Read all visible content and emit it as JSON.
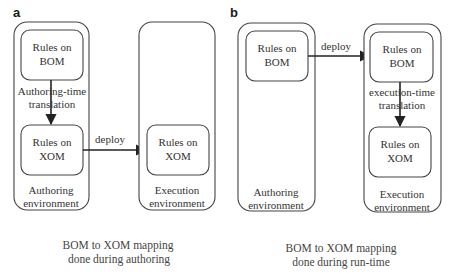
{
  "panels": [
    {
      "label": "a",
      "left_env": {
        "title_line1": "Authoring",
        "title_line2": "environment",
        "top_box": {
          "line1": "Rules on",
          "line2": "BOM"
        },
        "translation": {
          "line1": "Authoring-time",
          "line2": "translation"
        },
        "bottom_box": {
          "line1": "Rules on",
          "line2": "XOM"
        }
      },
      "right_env": {
        "title_line1": "Execution",
        "title_line2": "environment",
        "box": {
          "line1": "Rules on",
          "line2": "XOM"
        }
      },
      "arrow_label": "deploy",
      "caption_line1": "BOM to XOM mapping",
      "caption_line2": "done during authoring"
    },
    {
      "label": "b",
      "left_env": {
        "title_line1": "Authoring",
        "title_line2": "environment",
        "box": {
          "line1": "Rules on",
          "line2": "BOM"
        }
      },
      "right_env": {
        "title_line1": "Execution",
        "title_line2": "environment",
        "top_box": {
          "line1": "Rules on",
          "line2": "BOM"
        },
        "translation": {
          "line1": "execution-time",
          "line2": "translation"
        },
        "bottom_box": {
          "line1": "Rules on",
          "line2": "XOM"
        }
      },
      "arrow_label": "deploy",
      "caption_line1": "BOM to XOM mapping",
      "caption_line2": "done during run-time"
    }
  ]
}
